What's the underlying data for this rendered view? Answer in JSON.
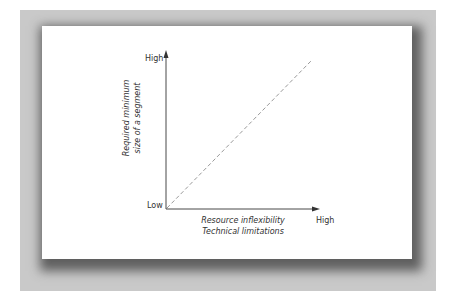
{
  "diagram": {
    "y_axis": {
      "high_label": "High",
      "low_label": "Low",
      "title_line1": "Required minimum",
      "title_line2": "size of a segment"
    },
    "x_axis": {
      "high_label": "High",
      "title_line1": "Resource inflexibility",
      "title_line2": "Technical limitations"
    },
    "line": {
      "style": "dashed",
      "color": "#999999",
      "direction": "increasing"
    }
  }
}
